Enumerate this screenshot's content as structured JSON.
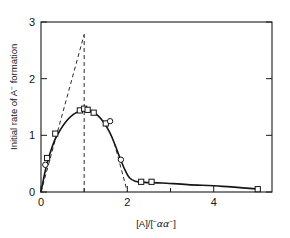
{
  "chart_data": {
    "type": "scatter",
    "title": "",
    "subtitle": "",
    "xlabel": "[A]/[ ⁻αα⁻ ]",
    "xlabel_parts": {
      "bracket_open": "[A]/[",
      "sup_left": "−",
      "greek": "αα",
      "sup_right": "−",
      "bracket_close": "]"
    },
    "ylabel": "Initial rate of A⁻ formation",
    "ylabel_parts": {
      "lead": "Initial rate of A",
      "sup": "−",
      "trail": " formation"
    },
    "xlim": [
      0,
      5.35
    ],
    "ylim": [
      0,
      3
    ],
    "xticks": [
      0,
      1,
      2,
      3,
      4,
      5
    ],
    "xtick_labels": [
      "0",
      "",
      "2",
      "",
      "4",
      ""
    ],
    "yticks": [
      0,
      1,
      2,
      3
    ],
    "ytick_labels": [
      "0",
      "1",
      "2",
      "3"
    ],
    "grid": false,
    "legend": "none",
    "series": [
      {
        "name": "square markers",
        "marker": "open-square",
        "points": [
          {
            "x": 0.14,
            "y": 0.6
          },
          {
            "x": 0.33,
            "y": 1.03
          },
          {
            "x": 0.9,
            "y": 1.44
          },
          {
            "x": 1.0,
            "y": 1.47
          },
          {
            "x": 1.08,
            "y": 1.45
          },
          {
            "x": 1.22,
            "y": 1.4
          },
          {
            "x": 1.5,
            "y": 1.21
          },
          {
            "x": 2.32,
            "y": 0.18
          },
          {
            "x": 2.56,
            "y": 0.18
          },
          {
            "x": 5.02,
            "y": 0.05
          }
        ]
      },
      {
        "name": "circle markers",
        "marker": "open-circle",
        "points": [
          {
            "x": 0.1,
            "y": 0.48
          },
          {
            "x": 1.6,
            "y": 1.25
          },
          {
            "x": 1.85,
            "y": 0.57
          }
        ]
      }
    ],
    "fitted_curve": [
      {
        "x": 0.0,
        "y": 0.0
      },
      {
        "x": 0.1,
        "y": 0.38
      },
      {
        "x": 0.2,
        "y": 0.66
      },
      {
        "x": 0.32,
        "y": 0.92
      },
      {
        "x": 0.45,
        "y": 1.1
      },
      {
        "x": 0.6,
        "y": 1.26
      },
      {
        "x": 0.75,
        "y": 1.37
      },
      {
        "x": 0.9,
        "y": 1.43
      },
      {
        "x": 1.02,
        "y": 1.45
      },
      {
        "x": 1.15,
        "y": 1.43
      },
      {
        "x": 1.3,
        "y": 1.36
      },
      {
        "x": 1.45,
        "y": 1.23
      },
      {
        "x": 1.6,
        "y": 1.04
      },
      {
        "x": 1.72,
        "y": 0.82
      },
      {
        "x": 1.84,
        "y": 0.58
      },
      {
        "x": 1.95,
        "y": 0.38
      },
      {
        "x": 2.05,
        "y": 0.25
      },
      {
        "x": 2.18,
        "y": 0.19
      },
      {
        "x": 2.4,
        "y": 0.17
      },
      {
        "x": 2.8,
        "y": 0.16
      },
      {
        "x": 3.4,
        "y": 0.13
      },
      {
        "x": 4.2,
        "y": 0.1
      },
      {
        "x": 5.05,
        "y": 0.05
      }
    ],
    "annotations": [
      {
        "name": "initial-slope-tangent",
        "style": "dashed",
        "from": {
          "x": 0.0,
          "y": 0.0
        },
        "to": {
          "x": 1.0,
          "y": 2.78
        }
      },
      {
        "name": "stoichiometry-vertical",
        "style": "dashed",
        "from": {
          "x": 1.0,
          "y": 0.0
        },
        "to": {
          "x": 1.0,
          "y": 2.78
        }
      },
      {
        "name": "descending-limb-extrapolation",
        "style": "dashed",
        "from": {
          "x": 1.7,
          "y": 0.86
        },
        "to": {
          "x": 2.0,
          "y": 0.0
        }
      }
    ]
  },
  "figure": {
    "background_color": "#ffffff",
    "axis_color": "#1a1a1a",
    "curve_color": "#151515",
    "marker_fill": "#ffffff"
  }
}
